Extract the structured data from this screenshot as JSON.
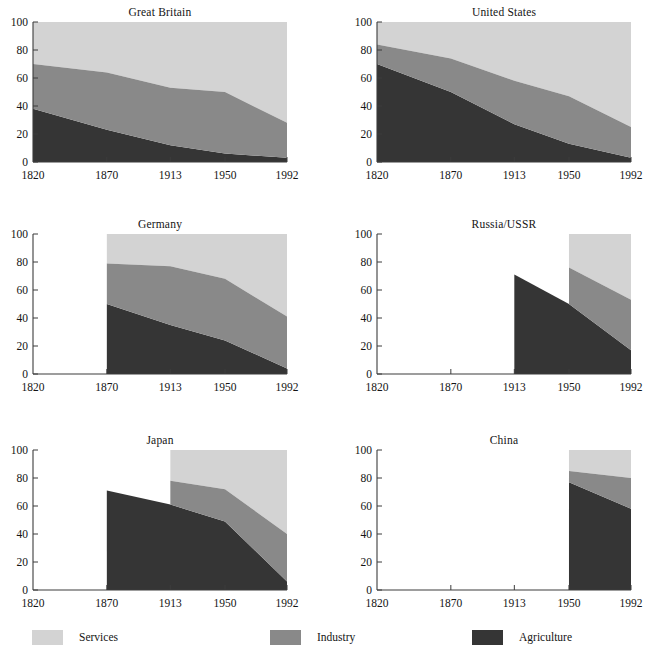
{
  "figure": {
    "width": 641,
    "height": 663,
    "background": "#ffffff"
  },
  "legend": {
    "items": [
      {
        "label": "Services",
        "color": "#d3d3d3",
        "x": 32
      },
      {
        "label": "Industry",
        "color": "#898989",
        "x": 270
      },
      {
        "label": "Agriculture",
        "color": "#353535",
        "x": 472
      }
    ]
  },
  "colors": {
    "services": "#d3d3d3",
    "industry": "#898989",
    "agriculture": "#353535",
    "axis": "#3c3c3c",
    "text": "#141414"
  },
  "axes": {
    "x_ticks": [
      "1820",
      "1870",
      "1913",
      "1950",
      "1992"
    ],
    "x_values": [
      1820,
      1870,
      1913,
      1950,
      1992
    ],
    "y_ticks": [
      "0",
      "20",
      "40",
      "60",
      "80",
      "100"
    ],
    "y_values": [
      0,
      20,
      40,
      60,
      80,
      100
    ],
    "ylim": [
      0,
      100
    ],
    "grid": false
  },
  "chart_data": {
    "type": "area",
    "title": "",
    "subtitle": "",
    "xlabel": "",
    "ylabel": "",
    "ylim": [
      0,
      100
    ],
    "grid": false,
    "legend_position": "bottom",
    "stacked": true,
    "x": [
      1820,
      1870,
      1913,
      1950,
      1992
    ],
    "x_tick_labels": [
      "1820",
      "1870",
      "1913",
      "1950",
      "1992"
    ],
    "y_tick_labels": [
      "0",
      "20",
      "40",
      "60",
      "80",
      "100"
    ],
    "series_names": [
      "Agriculture",
      "Industry",
      "Services"
    ],
    "series_colors": [
      "#353535",
      "#898989",
      "#d3d3d3"
    ],
    "note": "Each panel shows shares of employment by sector (percent, stacking to 100). Missing years are left blank.",
    "panels": [
      {
        "title": "Great Britain",
        "row": 0,
        "col": 0,
        "x": [
          1820,
          1870,
          1913,
          1950,
          1992
        ],
        "agriculture": [
          38,
          23,
          12,
          6,
          3
        ],
        "industry": [
          32,
          41,
          41,
          44,
          25
        ],
        "services": [
          30,
          36,
          47,
          50,
          72
        ],
        "agriculture_top": [
          38,
          23,
          12,
          6,
          3
        ],
        "industry_top": [
          70,
          64,
          53,
          50,
          28
        ]
      },
      {
        "title": "United States",
        "row": 0,
        "col": 1,
        "x": [
          1820,
          1870,
          1913,
          1950,
          1992
        ],
        "agriculture": [
          70,
          50,
          27,
          13,
          3
        ],
        "industry": [
          14,
          24,
          31,
          34,
          22
        ],
        "services": [
          16,
          26,
          42,
          53,
          75
        ],
        "agriculture_top": [
          70,
          50,
          27,
          13,
          3
        ],
        "industry_top": [
          84,
          74,
          58,
          47,
          25
        ]
      },
      {
        "title": "Germany",
        "row": 1,
        "col": 0,
        "x": [
          1870,
          1913,
          1950,
          1992
        ],
        "agriculture": [
          50,
          35,
          24,
          4
        ],
        "industry": [
          29,
          42,
          44,
          37
        ],
        "services": [
          21,
          23,
          32,
          59
        ],
        "agriculture_top": [
          50,
          35,
          24,
          4
        ],
        "industry_top": [
          79,
          77,
          68,
          41
        ]
      },
      {
        "title": "Russia/USSR",
        "row": 1,
        "col": 1,
        "x": [
          1913,
          1950,
          1992
        ],
        "agriculture": [
          71,
          50,
          17
        ],
        "industry": [
          null,
          26,
          36
        ],
        "services": [
          null,
          24,
          47
        ],
        "agriculture_top": [
          71,
          50,
          17
        ],
        "industry_top": [
          null,
          76,
          53
        ],
        "upper_bands_start_year": 1950
      },
      {
        "title": "Japan",
        "row": 2,
        "col": 0,
        "x": [
          1870,
          1913,
          1950,
          1992
        ],
        "agriculture": [
          71,
          61,
          49,
          6
        ],
        "industry": [
          null,
          17,
          23,
          34
        ],
        "services": [
          null,
          22,
          28,
          60
        ],
        "agriculture_top": [
          71,
          61,
          49,
          6
        ],
        "industry_top": [
          null,
          78,
          72,
          40
        ],
        "upper_bands_start_year": 1913
      },
      {
        "title": "China",
        "row": 2,
        "col": 1,
        "x": [
          1950,
          1992
        ],
        "agriculture": [
          77,
          58
        ],
        "industry": [
          8,
          22
        ],
        "services": [
          15,
          20
        ],
        "agriculture_top": [
          77,
          58
        ],
        "industry_top": [
          85,
          80
        ],
        "upper_bands_start_year": 1950
      }
    ]
  }
}
